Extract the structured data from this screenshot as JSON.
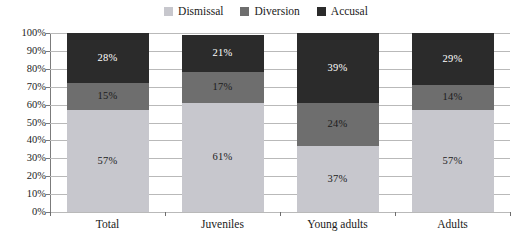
{
  "chart_data": {
    "type": "bar",
    "subtype": "stacked-100-percent",
    "title": "",
    "xlabel": "",
    "ylabel": "",
    "categories": [
      "Total",
      "Juveniles",
      "Young adults",
      "Adults"
    ],
    "series": [
      {
        "name": "Dismissal",
        "color": "#c7c7cd",
        "values": [
          57,
          61,
          37,
          57
        ],
        "labels": [
          "57%",
          "61%",
          "37%",
          "57%"
        ],
        "label_colors": [
          "#1c1c1c",
          "#1c1c1c",
          "#1c1c1c",
          "#1c1c1c"
        ]
      },
      {
        "name": "Diversion",
        "color": "#6e6e6e",
        "values": [
          15,
          17,
          24,
          14
        ],
        "labels": [
          "15%",
          "17%",
          "24%",
          "14%"
        ],
        "label_colors": [
          "#1c1c1c",
          "#1c1c1c",
          "#1c1c1c",
          "#1c1c1c"
        ]
      },
      {
        "name": "Accusal",
        "color": "#2b2b2b",
        "values": [
          28,
          21,
          39,
          29
        ],
        "labels": [
          "28%",
          "21%",
          "39%",
          "29%"
        ],
        "label_colors": [
          "#ffffff",
          "#ffffff",
          "#ffffff",
          "#ffffff"
        ]
      }
    ],
    "ylim": [
      0,
      100
    ],
    "ytick_labels": [
      "100%",
      "90%",
      "80%",
      "70%",
      "60%",
      "50%",
      "40%",
      "30%",
      "20%",
      "10%",
      "0%"
    ],
    "ytick_values": [
      100,
      90,
      80,
      70,
      60,
      50,
      40,
      30,
      20,
      10,
      0
    ],
    "grid": true,
    "grid_axis": "y",
    "legend_position": "top-center",
    "legend_entries": [
      "Dismissal",
      "Diversion",
      "Accusal"
    ],
    "colors": {
      "dismissal": "#c7c7cd",
      "diversion": "#6e6e6e",
      "accusal": "#2b2b2b",
      "gridline": "#b9b9b9",
      "axis": "#6d6d6d",
      "text": "#1c1c1c",
      "background": "#ffffff"
    }
  }
}
